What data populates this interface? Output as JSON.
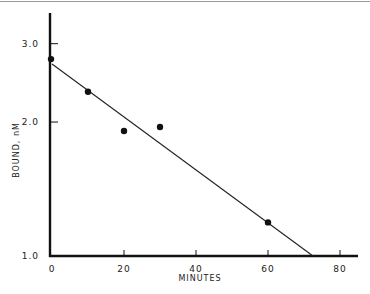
{
  "chart_data": {
    "type": "scatter",
    "title": "",
    "xlabel": "MINUTES",
    "ylabel": "BOUND, nM",
    "xlim": [
      0,
      85
    ],
    "ylim": [
      1.0,
      3.5
    ],
    "yscale": "log",
    "grid": false,
    "legend": null,
    "x_ticks": [
      0,
      20,
      40,
      60,
      80
    ],
    "x_tick_labels": [
      "0",
      "20",
      "40",
      "60",
      "80"
    ],
    "y_ticks": [
      1.0,
      2.0,
      3.0
    ],
    "y_tick_labels": [
      "1.0",
      "2.0",
      "3.0"
    ],
    "series": [
      {
        "name": "data points",
        "type": "scatter",
        "x": [
          0,
          10,
          20,
          30,
          60
        ],
        "y": [
          2.77,
          2.34,
          1.91,
          1.95,
          1.19
        ]
      },
      {
        "name": "fit line",
        "type": "line",
        "x": [
          0,
          72.5
        ],
        "y": [
          2.7,
          1.0
        ]
      }
    ]
  }
}
